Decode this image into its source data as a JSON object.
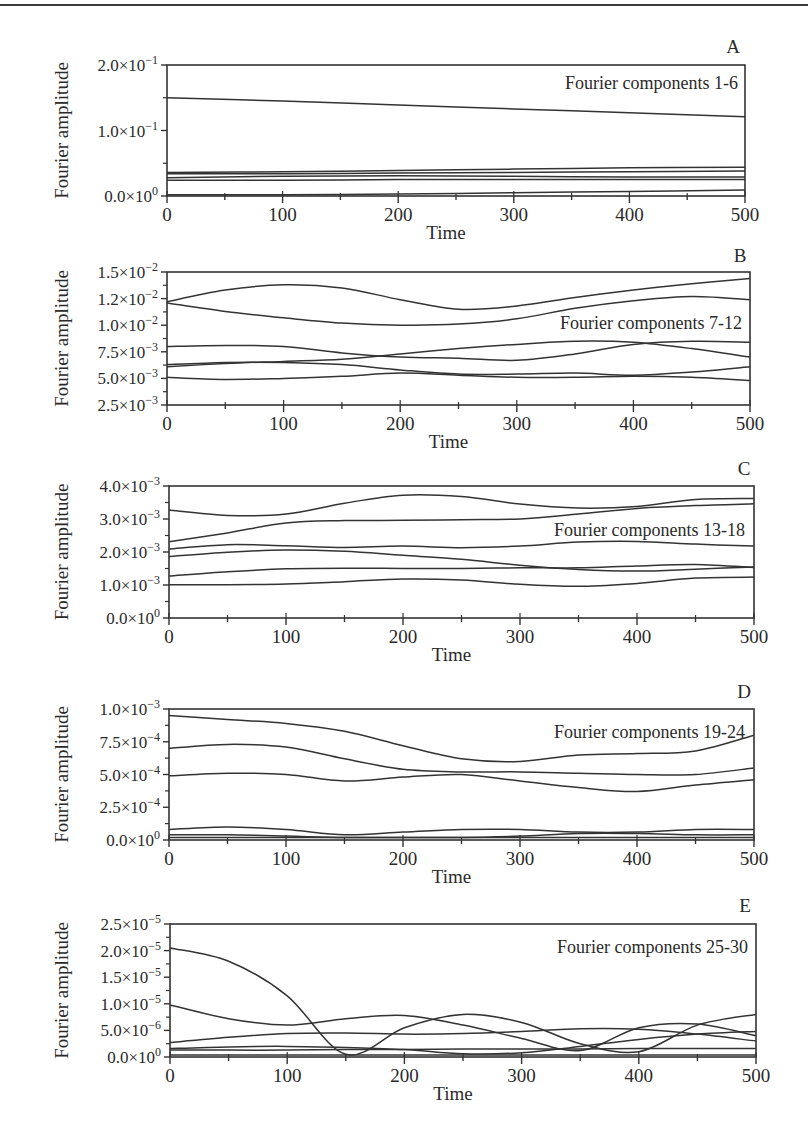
{
  "figure": {
    "x_label": "Time",
    "y_label": "Fourier amplitude",
    "x_ticks": [
      "0",
      "100",
      "200",
      "300",
      "400",
      "500"
    ]
  },
  "chart_data": [
    {
      "panel": "A",
      "type": "line",
      "title": "Fourier components 1-6",
      "xlabel": "Time",
      "ylabel": "Fourier amplitude",
      "xlim": [
        0,
        500
      ],
      "ylim": [
        0,
        0.2
      ],
      "x_tick_labels": [
        "0",
        "100",
        "200",
        "300",
        "400",
        "500"
      ],
      "y_tick_labels": [
        "0.0×10^0",
        "1.0×10^-1",
        "2.0×10^-1"
      ],
      "y_ticks": [
        0,
        0.1,
        0.2
      ],
      "x": [
        0,
        100,
        200,
        300,
        400,
        500
      ],
      "series": [
        {
          "name": "component 1",
          "values": [
            0.15,
            0.145,
            0.139,
            0.133,
            0.127,
            0.121
          ]
        },
        {
          "name": "component 2",
          "values": [
            0.036,
            0.037,
            0.039,
            0.041,
            0.043,
            0.044
          ]
        },
        {
          "name": "component 3",
          "values": [
            0.034,
            0.034,
            0.035,
            0.036,
            0.037,
            0.038
          ]
        },
        {
          "name": "component 4",
          "values": [
            0.028,
            0.03,
            0.031,
            0.03,
            0.029,
            0.029
          ]
        },
        {
          "name": "component 5",
          "values": [
            0.024,
            0.024,
            0.025,
            0.025,
            0.025,
            0.025
          ]
        },
        {
          "name": "component 6",
          "values": [
            0.002,
            0.002,
            0.003,
            0.005,
            0.007,
            0.009
          ]
        }
      ]
    },
    {
      "panel": "B",
      "type": "line",
      "title": "Fourier components 7-12",
      "xlabel": "Time",
      "ylabel": "Fourier amplitude",
      "xlim": [
        0,
        500
      ],
      "ylim": [
        0.0025,
        0.015
      ],
      "x_tick_labels": [
        "0",
        "100",
        "200",
        "300",
        "400",
        "500"
      ],
      "y_tick_labels": [
        "2.5×10^-3",
        "5.0×10^-3",
        "7.5×10^-3",
        "1.0×10^-2",
        "1.2×10^-2",
        "1.5×10^-2"
      ],
      "y_ticks": [
        0.0025,
        0.005,
        0.0075,
        0.01,
        0.0125,
        0.015
      ],
      "x": [
        0,
        50,
        100,
        150,
        200,
        250,
        300,
        350,
        400,
        450,
        500
      ],
      "series": [
        {
          "name": "component 7",
          "values": [
            0.0122,
            0.0133,
            0.0138,
            0.0135,
            0.0124,
            0.0115,
            0.0118,
            0.0126,
            0.0133,
            0.0139,
            0.0144
          ]
        },
        {
          "name": "component 8",
          "values": [
            0.0121,
            0.0113,
            0.0107,
            0.0102,
            0.01,
            0.0101,
            0.0106,
            0.0116,
            0.0123,
            0.0127,
            0.0124
          ]
        },
        {
          "name": "component 9",
          "values": [
            0.008,
            0.0081,
            0.008,
            0.0074,
            0.007,
            0.0069,
            0.0067,
            0.0073,
            0.0082,
            0.0085,
            0.0084
          ]
        },
        {
          "name": "component 10",
          "values": [
            0.0061,
            0.0064,
            0.0066,
            0.0068,
            0.0073,
            0.0078,
            0.0082,
            0.0085,
            0.0084,
            0.0078,
            0.007
          ]
        },
        {
          "name": "component 11",
          "values": [
            0.0063,
            0.0065,
            0.0065,
            0.0063,
            0.0058,
            0.0054,
            0.0054,
            0.0055,
            0.0053,
            0.0056,
            0.0061
          ]
        },
        {
          "name": "component 12",
          "values": [
            0.0051,
            0.0049,
            0.005,
            0.0052,
            0.0055,
            0.0053,
            0.0051,
            0.0051,
            0.0052,
            0.0051,
            0.0048
          ]
        }
      ]
    },
    {
      "panel": "C",
      "type": "line",
      "title": "Fourier components 13-18",
      "xlabel": "Time",
      "ylabel": "Fourier amplitude",
      "xlim": [
        0,
        500
      ],
      "ylim": [
        0,
        0.004
      ],
      "x_tick_labels": [
        "0",
        "100",
        "200",
        "300",
        "400",
        "500"
      ],
      "y_tick_labels": [
        "0.0×10^0",
        "1.0×10^-3",
        "2.0×10^-3",
        "3.0×10^-3",
        "4.0×10^-3"
      ],
      "y_ticks": [
        0,
        0.001,
        0.002,
        0.003,
        0.004
      ],
      "x": [
        0,
        50,
        100,
        150,
        200,
        250,
        300,
        350,
        400,
        450,
        500
      ],
      "series": [
        {
          "name": "component 13",
          "values": [
            0.00327,
            0.00311,
            0.00315,
            0.00348,
            0.00372,
            0.00368,
            0.00345,
            0.00333,
            0.00338,
            0.00359,
            0.00362
          ]
        },
        {
          "name": "component 14",
          "values": [
            0.00231,
            0.00258,
            0.00288,
            0.00295,
            0.00296,
            0.00298,
            0.003,
            0.00315,
            0.00332,
            0.00341,
            0.00346
          ]
        },
        {
          "name": "component 15",
          "values": [
            0.00209,
            0.00222,
            0.00219,
            0.00214,
            0.00218,
            0.00213,
            0.00218,
            0.0023,
            0.00232,
            0.00224,
            0.00218
          ]
        },
        {
          "name": "component 16",
          "values": [
            0.00186,
            0.00199,
            0.00206,
            0.00202,
            0.0019,
            0.00178,
            0.0016,
            0.00147,
            0.00142,
            0.00148,
            0.00155
          ]
        },
        {
          "name": "component 17",
          "values": [
            0.00127,
            0.0014,
            0.00149,
            0.00151,
            0.0015,
            0.0015,
            0.00152,
            0.00152,
            0.00158,
            0.00162,
            0.00153
          ]
        },
        {
          "name": "component 18",
          "values": [
            0.00101,
            0.00101,
            0.00103,
            0.0011,
            0.00118,
            0.00115,
            0.00102,
            0.00096,
            0.00105,
            0.00121,
            0.00124
          ]
        }
      ]
    },
    {
      "panel": "D",
      "type": "line",
      "title": "Fourier components 19-24",
      "xlabel": "Time",
      "ylabel": "Fourier amplitude",
      "xlim": [
        0,
        500
      ],
      "ylim": [
        0,
        0.001
      ],
      "x_tick_labels": [
        "0",
        "100",
        "200",
        "300",
        "400",
        "500"
      ],
      "y_tick_labels": [
        "0.0×10^0",
        "2.5×10^-4",
        "5.0×10^-4",
        "7.5×10^-4",
        "1.0×10^-3"
      ],
      "y_ticks": [
        0,
        0.00025,
        0.0005,
        0.00075,
        0.001
      ],
      "x": [
        0,
        50,
        100,
        150,
        200,
        250,
        300,
        350,
        400,
        450,
        500
      ],
      "series": [
        {
          "name": "component 19",
          "values": [
            0.00095,
            0.00092,
            0.00089,
            0.00083,
            0.00072,
            0.00062,
            0.0006,
            0.00065,
            0.00066,
            0.00068,
            0.0008
          ]
        },
        {
          "name": "component 20",
          "values": [
            0.0007,
            0.00073,
            0.00071,
            0.00062,
            0.00054,
            0.00052,
            0.00052,
            0.00051,
            0.0005,
            0.0005,
            0.00055
          ]
        },
        {
          "name": "component 21",
          "values": [
            0.00049,
            0.00051,
            0.0005,
            0.00045,
            0.00048,
            0.0005,
            0.00045,
            0.0004,
            0.00037,
            0.00042,
            0.00046
          ]
        },
        {
          "name": "component 22",
          "values": [
            8e-05,
            0.0001,
            8e-05,
            4e-05,
            6e-05,
            8e-05,
            8e-05,
            6e-05,
            6e-05,
            8e-05,
            8e-05
          ]
        },
        {
          "name": "component 23",
          "values": [
            4e-05,
            4e-05,
            3e-05,
            2e-05,
            2e-05,
            2e-05,
            3e-05,
            5e-05,
            5e-05,
            4e-05,
            4e-05
          ]
        },
        {
          "name": "component 24",
          "values": [
            2e-05,
            2e-05,
            2e-05,
            2e-05,
            2e-05,
            2e-05,
            2e-05,
            2e-05,
            2e-05,
            2e-05,
            2e-05
          ]
        }
      ]
    },
    {
      "panel": "E",
      "type": "line",
      "title": "Fourier components 25-30",
      "xlabel": "Time",
      "ylabel": "Fourier amplitude",
      "xlim": [
        0,
        500
      ],
      "ylim": [
        0,
        2.5e-05
      ],
      "x_tick_labels": [
        "0",
        "100",
        "200",
        "300",
        "400",
        "500"
      ],
      "y_tick_labels": [
        "0.0×10^0",
        "5.0×10^-6",
        "1.0×10^-5",
        "1.5×10^-5",
        "2.0×10^-5",
        "2.5×10^-5"
      ],
      "y_ticks": [
        0,
        5e-06,
        1e-05,
        1.5e-05,
        2e-05,
        2.5e-05
      ],
      "x": [
        0,
        50,
        100,
        150,
        200,
        250,
        300,
        350,
        400,
        450,
        500
      ],
      "series": [
        {
          "name": "component 25",
          "values": [
            2.05e-05,
            1.8e-05,
            1.15e-05,
            5e-07,
            5.5e-06,
            8e-06,
            6.5e-06,
            2.5e-06,
            1e-06,
            6e-06,
            8e-06
          ]
        },
        {
          "name": "component 26",
          "values": [
            9.8e-06,
            7.2e-06,
            6e-06,
            7.2e-06,
            7.8e-06,
            6e-06,
            3.5e-06,
            1.2e-06,
            5.5e-06,
            6.2e-06,
            4e-06
          ]
        },
        {
          "name": "component 27",
          "values": [
            2.7e-06,
            3.7e-06,
            4.4e-06,
            4.5e-06,
            4.3e-06,
            4.4e-06,
            4.8e-06,
            5.3e-06,
            5.2e-06,
            4.3e-06,
            3e-06
          ]
        },
        {
          "name": "component 28",
          "values": [
            1.6e-06,
            1.9e-06,
            2e-06,
            1.8e-06,
            1.4e-06,
            6e-07,
            8e-07,
            2e-06,
            3.3e-06,
            4.3e-06,
            4.8e-06
          ]
        },
        {
          "name": "component 29",
          "values": [
            1.3e-06,
            1.3e-06,
            1.3e-06,
            1.4e-06,
            1.4e-06,
            1.5e-06,
            1.5e-06,
            1.5e-06,
            1.6e-06,
            1.6e-06,
            1.6e-06
          ]
        },
        {
          "name": "component 30",
          "values": [
            4e-07,
            4e-07,
            4e-07,
            4e-07,
            4e-07,
            4e-07,
            4e-07,
            4e-07,
            4e-07,
            4e-07,
            4e-07
          ]
        }
      ]
    }
  ],
  "layout": {
    "panels": [
      {
        "left": 167,
        "top": 65,
        "right": 745,
        "bottom": 196,
        "label_x": 733,
        "label_y": 53,
        "title_x": 738,
        "title_y": 89
      },
      {
        "left": 167,
        "top": 272,
        "right": 750,
        "bottom": 405,
        "label_x": 740,
        "label_y": 262,
        "title_x": 742,
        "title_y": 329
      },
      {
        "left": 169,
        "top": 486,
        "right": 754,
        "bottom": 618,
        "label_x": 744,
        "label_y": 475,
        "title_x": 745,
        "title_y": 536
      },
      {
        "left": 169,
        "top": 709,
        "right": 754,
        "bottom": 840,
        "label_x": 744,
        "label_y": 698,
        "title_x": 745,
        "title_y": 738
      },
      {
        "left": 170,
        "top": 924,
        "right": 756,
        "bottom": 1057,
        "label_x": 745,
        "label_y": 912,
        "title_x": 748,
        "title_y": 953
      }
    ],
    "line_color": "#333333"
  }
}
